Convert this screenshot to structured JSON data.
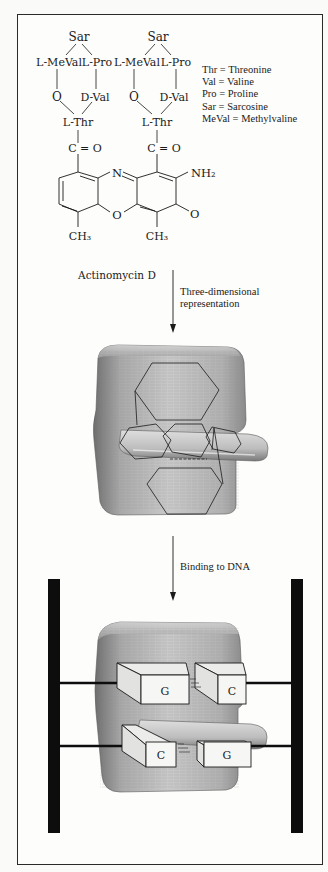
{
  "figure": {
    "structure": {
      "left_ring": {
        "top": "Sar",
        "left": "L-MeVal",
        "right": "L-Pro",
        "ester_o": "O",
        "d_val": "D-Val",
        "thr": "L-Thr",
        "carbonyl": "C = O"
      },
      "right_ring": {
        "top": "Sar",
        "left": "L-MeVal",
        "right": "L-Pro",
        "ester_o": "O",
        "d_val": "D-Val",
        "thr": "L-Thr",
        "carbonyl": "C = O"
      },
      "chromophore": {
        "ring_n": "N",
        "ring_o": "O",
        "amino": "NH₂",
        "keto_o": "O",
        "methyl_left": "CH₃",
        "methyl_right": "CH₃"
      },
      "compound_name": "Actinomycin D"
    },
    "legend": [
      {
        "abbr": "Thr",
        "full": "Threonine",
        "text": "Thr = Threonine"
      },
      {
        "abbr": "Val",
        "full": "Valine",
        "text": "Val = Valine"
      },
      {
        "abbr": "Pro",
        "full": "Proline",
        "text": "Pro = Proline"
      },
      {
        "abbr": "Sar",
        "full": "Sarcosine",
        "text": "Sar = Sarcosine"
      },
      {
        "abbr": "MeVal",
        "full": "Methylvaline",
        "text": "MeVal = Methylvaline"
      }
    ],
    "arrows": [
      {
        "label_line1": "Three-dimensional",
        "label_line2": "representation"
      },
      {
        "label_line1": "Binding to DNA"
      }
    ],
    "dna_complex": {
      "upper_pair": [
        "G",
        "C"
      ],
      "lower_pair": [
        "C",
        "G"
      ]
    },
    "colors": {
      "line": "#1a1a1a",
      "dna_strand": "#0d0d0d",
      "block_gray": "#9a9a9a",
      "box_face": "#f6f6f4"
    }
  }
}
